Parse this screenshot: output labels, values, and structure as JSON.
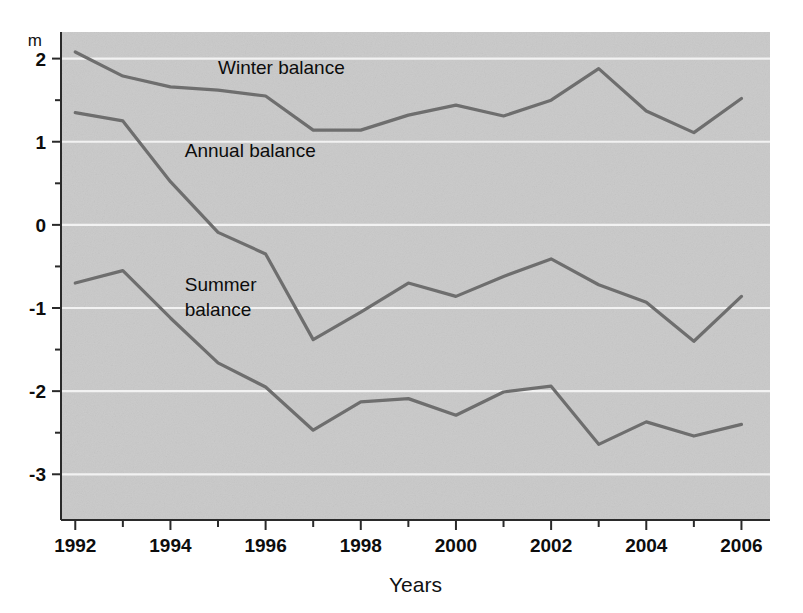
{
  "figure": {
    "background_color": "#ffffff",
    "plot_background_color": "#c9c9c9",
    "gridline_color": "#f2f2f2",
    "axis_color": "#2a2a2a",
    "line_color": "#6e6e6e",
    "unit_label": "m",
    "x_axis_title": "Years"
  },
  "labels": {
    "winter": "Winter balance",
    "annual": "Annual balance",
    "summer_line1": "Summer",
    "summer_line2": "balance"
  },
  "axis": {
    "y_ticks": [
      "2",
      "1",
      "0",
      "-1",
      "-2",
      "-3"
    ],
    "x_ticks": [
      "1992",
      "1994",
      "1996",
      "1998",
      "2000",
      "2002",
      "2004",
      "2006"
    ]
  },
  "chart_data": {
    "type": "line",
    "title": "",
    "subtitle": "",
    "xlabel": "Years",
    "ylabel": "m",
    "xlim": [
      1991.7,
      2006.6
    ],
    "ylim": [
      -3.55,
      2.32
    ],
    "grid": true,
    "gridlines_y": [
      2,
      1,
      0,
      -1,
      -2,
      -3
    ],
    "y_major_ticks": [
      2,
      1,
      0,
      -1,
      -2,
      -3
    ],
    "y_minor_ticks": [
      1.5,
      0.5,
      -0.5,
      -1.5,
      -2.5
    ],
    "x_major_ticks": [
      1992,
      1994,
      1996,
      1998,
      2000,
      2002,
      2004,
      2006
    ],
    "x_minor_ticks": [
      1993,
      1995,
      1997,
      1999,
      2001,
      2003,
      2005
    ],
    "legend": "inline-annotations",
    "legend_position": "inside-plot",
    "x": [
      1992,
      1993,
      1994,
      1995,
      1996,
      1997,
      1998,
      1999,
      2000,
      2001,
      2002,
      2003,
      2004,
      2005,
      2006
    ],
    "series": [
      {
        "name": "Winter balance",
        "color": "#6e6e6e",
        "values": [
          2.08,
          1.79,
          1.66,
          1.62,
          1.55,
          1.14,
          1.14,
          1.32,
          1.44,
          1.31,
          1.5,
          1.88,
          1.37,
          1.11,
          1.52
        ]
      },
      {
        "name": "Annual balance",
        "color": "#6e6e6e",
        "values": [
          1.35,
          1.25,
          0.52,
          -0.09,
          -0.35,
          -1.38,
          -1.05,
          -0.7,
          -0.86,
          -0.62,
          -0.41,
          -0.72,
          -0.93,
          -1.4,
          -0.86
        ]
      },
      {
        "name": "Summer balance",
        "color": "#6e6e6e",
        "values": [
          -0.7,
          -0.55,
          -1.12,
          -1.66,
          -1.95,
          -2.47,
          -2.13,
          -2.09,
          -2.29,
          -2.01,
          -1.94,
          -2.64,
          -2.37,
          -2.54,
          -2.4
        ]
      }
    ],
    "annotations": [
      {
        "text": "Winter balance",
        "x": 1995.0,
        "y": 1.82
      },
      {
        "text": "Annual balance",
        "x": 1994.3,
        "y": 0.82
      },
      {
        "text": "Summer balance",
        "x": 1994.3,
        "y": -0.8
      }
    ]
  }
}
